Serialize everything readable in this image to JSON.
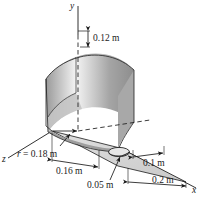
{
  "figure": {
    "type": "engineering-3d-diagram",
    "axes": {
      "y_label": "y",
      "x_label": "x",
      "z_label": "z"
    },
    "dimensions": [
      {
        "id": "height",
        "text": "0.12 m",
        "value": 0.12,
        "unit": "m"
      },
      {
        "id": "radius",
        "text": "r = 0.18 m",
        "value": 0.18,
        "unit": "m",
        "symbol": "r"
      },
      {
        "id": "base-offset",
        "text": "0.16 m",
        "value": 0.16,
        "unit": "m"
      },
      {
        "id": "hole-diameter",
        "text": "0.05 m",
        "value": 0.05,
        "unit": "m"
      },
      {
        "id": "hole-offset",
        "text": "0.1 m",
        "value": 0.1,
        "unit": "m"
      },
      {
        "id": "plate-length",
        "text": "0.2 m",
        "value": 0.2,
        "unit": "m"
      }
    ],
    "colors": {
      "line": "#1a1a1a",
      "surface_light": "#f2f2f2",
      "surface_mid": "#b9b9b9",
      "surface_dark": "#8a8a8a",
      "plate_fill": "#d6d6d6",
      "background": "#ffffff"
    }
  }
}
